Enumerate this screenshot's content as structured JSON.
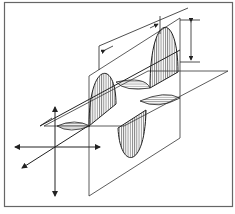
{
  "figure": {
    "type": "electromagnetic-wave-diagram",
    "colors": {
      "background": "#ffffff",
      "frame": "#555555",
      "line": "#222222",
      "hatch": "#444444"
    },
    "elements": {
      "vertical_wave_peaks": 2,
      "vertical_wave_troughs": 1,
      "horizontal_wave_lobes": 3,
      "wavelength_marker": "double-arrow between peaks",
      "amplitude_marker": "vertical double-arrow at right",
      "axes": [
        "horizontal",
        "vertical",
        "depth"
      ]
    }
  }
}
